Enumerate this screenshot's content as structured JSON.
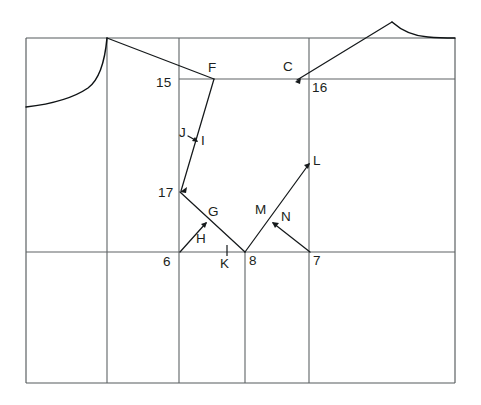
{
  "diagram": {
    "type": "line-drawing",
    "canvas": {
      "width": 481,
      "height": 405,
      "background": "#ffffff"
    },
    "stroke_colors": {
      "frame": "#555a5c",
      "grid": "#5e6365",
      "construction": "#15191b",
      "curve": "#0e1214"
    },
    "labels": [
      {
        "id": "label-15",
        "text": "15",
        "x": 156,
        "y": 76
      },
      {
        "id": "label-F",
        "text": "F",
        "x": 208,
        "y": 61
      },
      {
        "id": "label-C",
        "text": "C",
        "x": 283,
        "y": 60
      },
      {
        "id": "label-16",
        "text": "16",
        "x": 312,
        "y": 81
      },
      {
        "id": "label-J",
        "text": "J",
        "x": 179,
        "y": 126
      },
      {
        "id": "label-I",
        "text": "I",
        "x": 201,
        "y": 134
      },
      {
        "id": "label-L",
        "text": "L",
        "x": 313,
        "y": 154
      },
      {
        "id": "label-17",
        "text": "17",
        "x": 158,
        "y": 186
      },
      {
        "id": "label-G",
        "text": "G",
        "x": 208,
        "y": 205
      },
      {
        "id": "label-M",
        "text": "M",
        "x": 255,
        "y": 203
      },
      {
        "id": "label-N",
        "text": "N",
        "x": 281,
        "y": 210
      },
      {
        "id": "label-H",
        "text": "H",
        "x": 196,
        "y": 232
      },
      {
        "id": "label-6",
        "text": "6",
        "x": 163,
        "y": 255
      },
      {
        "id": "label-K",
        "text": "K",
        "x": 220,
        "y": 257
      },
      {
        "id": "label-8",
        "text": "8",
        "x": 249,
        "y": 254
      },
      {
        "id": "label-7",
        "text": "7",
        "x": 313,
        "y": 254
      }
    ],
    "frame": {
      "left": 26,
      "right": 455,
      "top": 38,
      "bottom": 383
    },
    "vertical_lines": [
      {
        "id": "v-left-edge",
        "x": 26,
        "y1": 38,
        "y2": 383
      },
      {
        "id": "v-shoulder",
        "x": 107,
        "y1": 38,
        "y2": 383
      },
      {
        "id": "v-front",
        "x": 179,
        "y1": 38,
        "y2": 383
      },
      {
        "id": "v-center",
        "x": 245,
        "y1": 252,
        "y2": 383
      },
      {
        "id": "v-back",
        "x": 309,
        "y1": 38,
        "y2": 383
      },
      {
        "id": "v-right-edge",
        "x": 455,
        "y1": 38,
        "y2": 383
      }
    ],
    "horizontal_lines": [
      {
        "id": "h-top",
        "y": 38,
        "x1": 26,
        "x2": 455
      },
      {
        "id": "h-chest",
        "y": 79,
        "x1": 179,
        "x2": 455
      },
      {
        "id": "h-waist",
        "y": 252,
        "x1": 26,
        "x2": 455
      },
      {
        "id": "h-bottom",
        "y": 383,
        "x1": 26,
        "x2": 455
      }
    ],
    "points": {
      "peak_left": {
        "x": 107,
        "y": 38
      },
      "peak_right": {
        "x": 392,
        "y": 22
      },
      "F": {
        "x": 214,
        "y": 79
      },
      "C": {
        "x": 296,
        "y": 81
      },
      "L": {
        "x": 310,
        "y": 163
      },
      "p17": {
        "x": 180,
        "y": 192
      },
      "G": {
        "x": 207,
        "y": 222
      },
      "M": {
        "x": 272,
        "y": 222
      },
      "p6": {
        "x": 180,
        "y": 252
      },
      "p8": {
        "x": 245,
        "y": 252
      },
      "p7": {
        "x": 310,
        "y": 252
      },
      "K": {
        "x": 227,
        "y": 252
      }
    }
  }
}
